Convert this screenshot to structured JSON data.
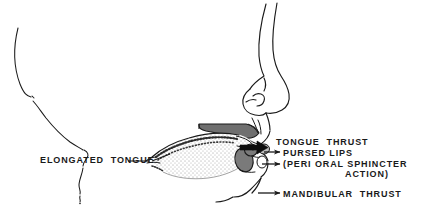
{
  "figure": {
    "type": "anatomical-line-drawing",
    "background_color": "#ffffff",
    "ink_color": "#1a1a1a",
    "shade_color": "#7a7a7a",
    "palate_color": "#6f6f6f"
  },
  "labels": {
    "elongated_tongue": "ELONGATED  TONGUE",
    "tongue_thrust": "TONGUE  THRUST",
    "pursed_lips": "PURSED LIPS",
    "peri_oral_line1": "(PERI ORAL SPHINCTER",
    "peri_oral_line2": "ACTION)",
    "mandibular_thrust": "MANDIBULAR  THRUST"
  },
  "parts": {
    "face_profile": "face-profile-outline",
    "nose": "nose-outline",
    "nostril": "nostril-outline",
    "hard_palate": "hard-palate-shape",
    "tongue": "elongated-tongue-shape",
    "upper_lip": "upper-lip-shape",
    "lower_lip": "lower-lip-shape",
    "chin": "chin-outline",
    "sketch_line": "loose-profile-sketch-line"
  },
  "arrows": {
    "tongue_thrust": "thick-black-arrow-right",
    "pursed_lips": "thin-arrow-right",
    "peri_oral": "thin-arrow-right",
    "mandibular_thrust": "thin-arrow-right",
    "elongated_tongue_leader": "leader-line"
  }
}
